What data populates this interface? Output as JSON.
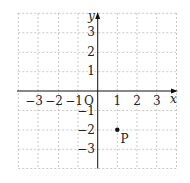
{
  "diagram": {
    "type": "coordinate-plane",
    "x_axis": {
      "label": "x",
      "min": -3,
      "max": 3,
      "ticks": [
        "−3",
        "−2",
        "−1",
        "1",
        "2",
        "3"
      ]
    },
    "y_axis": {
      "label": "y",
      "min": -3,
      "max": 3,
      "ticks": [
        "3",
        "2",
        "1",
        "−1",
        "−2",
        "−3"
      ]
    },
    "origin_label": "O",
    "grid": {
      "style": "dashed",
      "color": "#bbbbbb",
      "range": [
        -4,
        4
      ]
    },
    "points": [
      {
        "name": "P",
        "x": 1,
        "y": -2,
        "label": "P"
      }
    ],
    "colors": {
      "axis": "#111111",
      "grid": "#bbbbbb",
      "text": "#222222",
      "point": "#111111"
    }
  }
}
